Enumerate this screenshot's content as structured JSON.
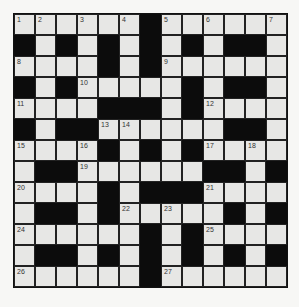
{
  "puzzle": {
    "rows": 13,
    "cols": 13,
    "colors": {
      "white_cell": "#e7e7e5",
      "black_cell": "#0c0c0c",
      "grid_line": "#222222"
    },
    "grid": [
      "WWWWWWBWWWWWW",
      "BWBWBWBWBWBBW",
      "WWWWBWBWWWWWW",
      "BWBWWWWWBWBBW",
      "WWWWBBBWBWWWW",
      "BWBBWWWWWWBBW",
      "WWWWBWBWBWWWW",
      "WBBWWWWWWBBWB",
      "WWWWBWBBBWWWW",
      "WBBWBWWWWWBWB",
      "WWWWWWBWBWWWW",
      "WBBWBWBWBWBWB",
      "WWWWWWBWWWWWW"
    ],
    "numbers": [
      {
        "r": 0,
        "c": 0,
        "n": "1"
      },
      {
        "r": 0,
        "c": 1,
        "n": "2"
      },
      {
        "r": 0,
        "c": 3,
        "n": "3"
      },
      {
        "r": 0,
        "c": 5,
        "n": "4"
      },
      {
        "r": 0,
        "c": 7,
        "n": "5"
      },
      {
        "r": 0,
        "c": 9,
        "n": "6"
      },
      {
        "r": 0,
        "c": 12,
        "n": "7"
      },
      {
        "r": 2,
        "c": 0,
        "n": "8"
      },
      {
        "r": 2,
        "c": 7,
        "n": "9"
      },
      {
        "r": 3,
        "c": 3,
        "n": "10"
      },
      {
        "r": 4,
        "c": 0,
        "n": "11"
      },
      {
        "r": 4,
        "c": 9,
        "n": "12"
      },
      {
        "r": 5,
        "c": 4,
        "n": "13"
      },
      {
        "r": 5,
        "c": 5,
        "n": "14"
      },
      {
        "r": 6,
        "c": 0,
        "n": "15"
      },
      {
        "r": 6,
        "c": 3,
        "n": "16"
      },
      {
        "r": 6,
        "c": 9,
        "n": "17"
      },
      {
        "r": 6,
        "c": 11,
        "n": "18"
      },
      {
        "r": 7,
        "c": 3,
        "n": "19"
      },
      {
        "r": 8,
        "c": 0,
        "n": "20"
      },
      {
        "r": 8,
        "c": 9,
        "n": "21"
      },
      {
        "r": 9,
        "c": 5,
        "n": "22"
      },
      {
        "r": 9,
        "c": 7,
        "n": "23"
      },
      {
        "r": 10,
        "c": 0,
        "n": "24"
      },
      {
        "r": 10,
        "c": 9,
        "n": "25"
      },
      {
        "r": 12,
        "c": 0,
        "n": "26"
      },
      {
        "r": 12,
        "c": 7,
        "n": "27"
      }
    ]
  }
}
